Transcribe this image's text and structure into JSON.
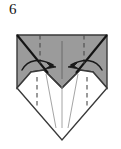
{
  "figure": {
    "step_number": "6",
    "type": "origami-fold-diagram"
  },
  "colors": {
    "paper_shaded": "#9b9b9b",
    "paper_shaded_light": "#a6a6a6",
    "paper_white": "#ffffff",
    "outline": "#3a3a3a",
    "outline_dark": "#141414",
    "crease_dashed": "#4a4a4a",
    "crease_thin": "#8a8a8a",
    "arrow": "#181818",
    "background": "#ffffff"
  },
  "geometry": {
    "top_left": [
      17,
      35
    ],
    "top_right": [
      107,
      35
    ],
    "left_corner": [
      17,
      88
    ],
    "right_corner": [
      107,
      88
    ],
    "bottom_point": [
      62,
      140
    ],
    "center_notch": [
      62,
      77
    ],
    "left_valley_apex": [
      44,
      70
    ],
    "right_valley_apex": [
      80,
      70
    ],
    "white_left_tip": [
      31,
      72
    ],
    "white_right_tip": [
      93,
      72
    ]
  },
  "elements": {
    "shaded_panel_label": "shaded paper region",
    "white_panel_label": "white paper region",
    "left_diagonal_crease": "diagonal crease from top-left corner",
    "right_diagonal_crease": "diagonal crease from top-right corner",
    "center_vertical_crease": "center vertical crease",
    "left_dashed_crease": "left vertical dashed crease",
    "right_dashed_crease": "right vertical dashed crease",
    "left_arrow_label": "curved fold arrow pointing right toward center",
    "right_arrow_label": "curved fold arrow pointing left toward center",
    "lower_left_dashed": "lower left vertical dashed crease",
    "lower_right_dashed": "lower right vertical dashed crease",
    "lower_center_crease": "lower center vertical crease",
    "lower_left_v_crease": "lower left slanted crease",
    "lower_right_v_crease": "lower right slanted crease"
  }
}
